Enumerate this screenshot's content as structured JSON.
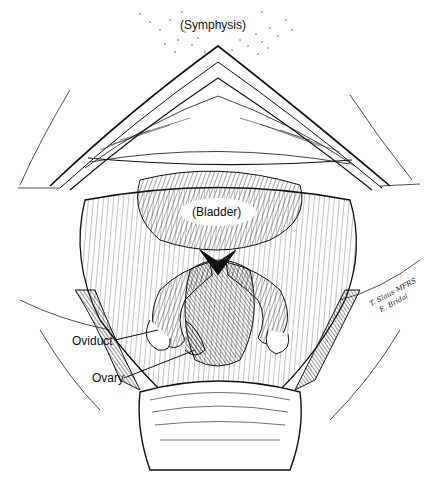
{
  "figure": {
    "type": "surgical line illustration",
    "colors": {
      "ink": "#111111",
      "background": "#ffffff"
    },
    "labels": {
      "symphysis": "(Symphysis)",
      "bladder": "(Bladder)",
      "oviduct": "Oviduct",
      "ovary": "Ovary"
    },
    "signature": {
      "line1": "T. Slaus MFRS",
      "line2": "E. Bridal"
    }
  }
}
